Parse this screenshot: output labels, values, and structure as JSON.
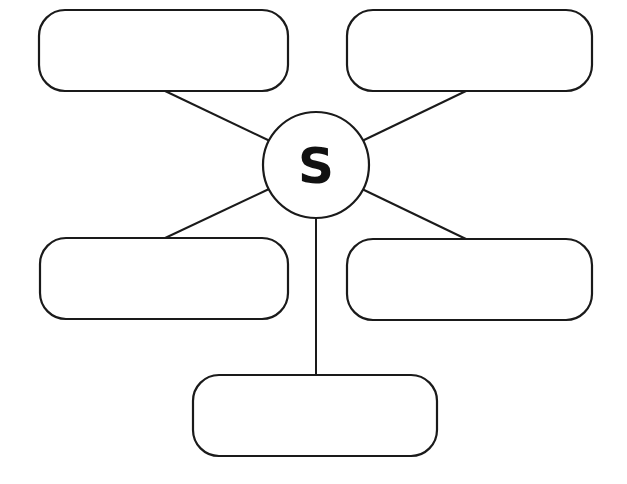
{
  "diagram": {
    "type": "spider-map",
    "center": {
      "label": "S"
    },
    "boxes": [
      {
        "id": "top-left",
        "text": ""
      },
      {
        "id": "top-right",
        "text": ""
      },
      {
        "id": "middle-left",
        "text": ""
      },
      {
        "id": "middle-right",
        "text": ""
      },
      {
        "id": "bottom",
        "text": ""
      }
    ],
    "colors": {
      "stroke": "#1a1a1a",
      "background": "#ffffff"
    }
  }
}
